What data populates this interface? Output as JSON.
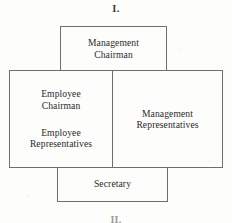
{
  "figure": {
    "label_top": "I.",
    "label_bottom": "II."
  },
  "diagram": {
    "type": "organizational-structure",
    "colors": {
      "paper": "#fdfdfb",
      "ink": "#2b2b2b",
      "rule": "#6f6f6f"
    },
    "boxes": {
      "top": {
        "name": "management-chairman",
        "text": "Management\nChairman"
      },
      "main": {
        "left_column": {
          "name": "employee-side",
          "block_1": "Employee\nChairman",
          "block_2": "Employee\nRepresentatives"
        },
        "right_column": {
          "name": "management-side",
          "block_1": "Management\nRepresentatives"
        }
      },
      "bottom": {
        "name": "secretary",
        "text": "Secretary"
      }
    }
  }
}
